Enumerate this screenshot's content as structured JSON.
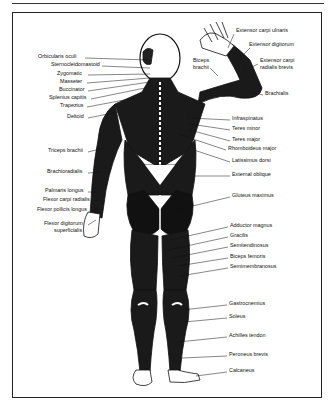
{
  "diagram": {
    "type": "anatomical-illustration",
    "colors": {
      "ink": "#111111",
      "background": "#ffffff",
      "frame": "#222222"
    },
    "labels_left": [
      {
        "text": "Orbicularis oculi",
        "x": 38,
        "y": 56
      },
      {
        "text": "Sternocleidomastoid",
        "x": 51,
        "y": 64
      },
      {
        "text": "Zygomatic",
        "x": 57,
        "y": 73
      },
      {
        "text": "Masseter",
        "x": 60,
        "y": 81
      },
      {
        "text": "Buccinator",
        "x": 59,
        "y": 89
      },
      {
        "text": "Splenius capitis",
        "x": 49,
        "y": 97
      },
      {
        "text": "Trapezius",
        "x": 60,
        "y": 105
      },
      {
        "text": "Deltoid",
        "x": 67,
        "y": 116
      },
      {
        "text": "Triceps brachii",
        "x": 48,
        "y": 150
      },
      {
        "text": "Brachioradialis",
        "x": 47,
        "y": 171
      },
      {
        "text": "Palmaris longus",
        "x": 45,
        "y": 190
      },
      {
        "text": "Flexor carpi radialis",
        "x": 43,
        "y": 199
      },
      {
        "text": "Flexor pollicis longus",
        "x": 37,
        "y": 209
      },
      {
        "text": "Flexor digitorum",
        "x": 44,
        "y": 223
      },
      {
        "text": "superficialis",
        "x": 54,
        "y": 230
      }
    ],
    "labels_right": [
      {
        "text": "Extensor carpi ulnaris",
        "x": 236,
        "y": 30
      },
      {
        "text": "Extensor digitorum",
        "x": 249,
        "y": 44
      },
      {
        "text": "Biceps",
        "x": 193,
        "y": 60
      },
      {
        "text": "brachii",
        "x": 193,
        "y": 67
      },
      {
        "text": "Extensor carpi",
        "x": 260,
        "y": 60
      },
      {
        "text": "radialis brevis",
        "x": 260,
        "y": 67
      },
      {
        "text": "Brachialis",
        "x": 265,
        "y": 93
      },
      {
        "text": "Infraspinatus",
        "x": 232,
        "y": 118
      },
      {
        "text": "Teres minor",
        "x": 232,
        "y": 128
      },
      {
        "text": "Teres major",
        "x": 232,
        "y": 139
      },
      {
        "text": "Rhomboideus major",
        "x": 228,
        "y": 148
      },
      {
        "text": "Latissimus dorsi",
        "x": 232,
        "y": 160
      },
      {
        "text": "External oblique",
        "x": 232,
        "y": 174
      },
      {
        "text": "Gluteus maximus",
        "x": 232,
        "y": 195
      },
      {
        "text": "Adductor magnus",
        "x": 230,
        "y": 225
      },
      {
        "text": "Gracilis",
        "x": 230,
        "y": 235
      },
      {
        "text": "Semitendinosus",
        "x": 230,
        "y": 245
      },
      {
        "text": "Biceps femoris",
        "x": 230,
        "y": 256
      },
      {
        "text": "Semimembranosus",
        "x": 230,
        "y": 266
      },
      {
        "text": "Gastrocnemius",
        "x": 229,
        "y": 303
      },
      {
        "text": "Soleus",
        "x": 229,
        "y": 316
      },
      {
        "text": "Achilles tendon",
        "x": 229,
        "y": 335
      },
      {
        "text": "Peroneus brevis",
        "x": 229,
        "y": 354
      },
      {
        "text": "Calcaneus",
        "x": 229,
        "y": 370
      }
    ]
  }
}
